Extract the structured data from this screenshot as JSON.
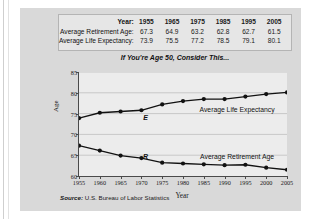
{
  "chart_data": {
    "type": "line",
    "title": "If You're Age 50, Consider This...",
    "xlabel": "Year",
    "ylabel": "Age",
    "xlim": [
      1955,
      2005
    ],
    "ylim": [
      60,
      85
    ],
    "yticks": [
      60,
      65,
      70,
      75,
      80,
      85
    ],
    "xticks": [
      1955,
      1960,
      1965,
      1970,
      1975,
      1980,
      1985,
      1990,
      1995,
      2000,
      2005
    ],
    "grid": "horizontal",
    "legend_position": "inline-annotation",
    "x": [
      1955,
      1960,
      1965,
      1970,
      1975,
      1980,
      1985,
      1990,
      1995,
      2000,
      2005
    ],
    "series": [
      {
        "name": "Average Life Expectancy",
        "tag": "E",
        "values": [
          73.9,
          75.2,
          75.5,
          75.8,
          77.2,
          78.0,
          78.5,
          78.5,
          79.1,
          79.7,
          80.1
        ]
      },
      {
        "name": "Average Retirement Age",
        "tag": "R",
        "values": [
          67.3,
          66.1,
          64.9,
          64.3,
          63.2,
          63.0,
          62.8,
          62.6,
          62.7,
          62.0,
          61.5
        ]
      }
    ],
    "source": "Source: U.S. Bureau of Labor Statistics",
    "source_word": "Source:",
    "source_rest": " U.S. Bureau of Labor Statistics"
  },
  "table": {
    "rows": [
      {
        "label": "Year:",
        "values": [
          "1955",
          "1965",
          "1975",
          "1985",
          "1995",
          "2005"
        ]
      },
      {
        "label": "Average Retirement Age:",
        "values": [
          "67.3",
          "64.9",
          "63.2",
          "62.8",
          "62.7",
          "61.5"
        ]
      },
      {
        "label": "Average Life Expectancy:",
        "values": [
          "73.9",
          "75.5",
          "77.2",
          "78.5",
          "79.1",
          "80.1"
        ]
      }
    ]
  },
  "colors": {
    "card_background": "#d9d9d9",
    "plot_background": "#ececec",
    "axis": "#4a4a4a",
    "gridline": "#b9b9b9",
    "series_line": "#111111",
    "table_background": "#e6e6e6",
    "table_border": "#b4b4b4"
  }
}
